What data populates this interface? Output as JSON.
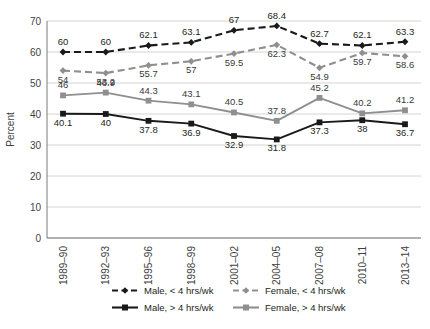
{
  "chart_data": {
    "type": "line",
    "title": "",
    "xlabel": "",
    "ylabel": "Percent",
    "ylim": [
      0,
      70
    ],
    "ytick_step": 10,
    "yticks": [
      "0",
      "10",
      "20",
      "30",
      "40",
      "50",
      "60",
      "70"
    ],
    "grid": true,
    "legend_position": "bottom",
    "categories": [
      "1989–90",
      "1992–93",
      "1995–96",
      "1998–99",
      "2001–02",
      "2004–05",
      "2007–08",
      "2010–11",
      "2013–14"
    ],
    "series": [
      {
        "name": "Male, < 4 hrs/wk",
        "color": "#1a1a1a",
        "linestyle": "dashed",
        "marker": "diamond",
        "label_position": "above",
        "values": [
          60,
          60,
          62.1,
          63.1,
          67,
          68.4,
          62.7,
          62.1,
          63.3
        ],
        "labels": [
          "60",
          "60",
          "62.1",
          "63.1",
          "67",
          "68.4",
          "62.7",
          "62.1",
          "63.3"
        ]
      },
      {
        "name": "Female, < 4 hrs/wk",
        "color": "#8f8f8f",
        "linestyle": "dashed",
        "marker": "diamond",
        "label_position": "below",
        "values": [
          54,
          53.2,
          55.7,
          57,
          59.5,
          62.3,
          54.9,
          59.7,
          58.6
        ],
        "labels": [
          "54",
          "53.2",
          "55.7",
          "57",
          "59.5",
          "62.3",
          "54.9",
          "59.7",
          "58.6"
        ]
      },
      {
        "name": "Male, > 4 hrs/wk",
        "color": "#1a1a1a",
        "linestyle": "solid",
        "marker": "square",
        "label_position": "below",
        "values": [
          40.1,
          40,
          37.8,
          36.9,
          32.9,
          31.8,
          37.3,
          38,
          36.7
        ],
        "labels": [
          "40.1",
          "40",
          "37.8",
          "36.9",
          "32.9",
          "31.8",
          "37.3",
          "38",
          "36.7"
        ]
      },
      {
        "name": "Female, > 4 hrs/wk",
        "color": "#8f8f8f",
        "linestyle": "solid",
        "marker": "square",
        "label_position": "above",
        "values": [
          46,
          46.9,
          44.3,
          43.1,
          40.5,
          37.8,
          45.2,
          40.2,
          41.2
        ],
        "labels": [
          "46",
          "46.9",
          "44.3",
          "43.1",
          "40.5",
          "37.8",
          "45.2",
          "40.2",
          "41.2"
        ]
      }
    ],
    "legend": [
      {
        "label": "Male, < 4 hrs/wk",
        "color": "#1a1a1a",
        "marker": "diamond",
        "linestyle": "dashed"
      },
      {
        "label": "Female, < 4 hrs/wk",
        "color": "#8f8f8f",
        "marker": "diamond",
        "linestyle": "dashed"
      },
      {
        "label": "Male, > 4 hrs/wk",
        "color": "#1a1a1a",
        "marker": "square",
        "linestyle": "solid"
      },
      {
        "label": "Female, > 4 hrs/wk",
        "color": "#8f8f8f",
        "marker": "square",
        "linestyle": "solid"
      }
    ]
  }
}
